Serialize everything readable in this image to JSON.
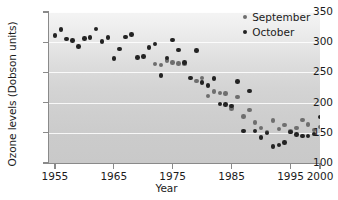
{
  "chart_data": {
    "type": "scatter",
    "title": "",
    "xlabel": "Year",
    "ylabel": "Ozone levels (Dobson units)",
    "xlim": [
      1954,
      2000
    ],
    "ylim": [
      100,
      350
    ],
    "xticks": [
      1955,
      1965,
      1975,
      1985,
      1995,
      2000
    ],
    "xtick_labels": [
      "1955",
      "1965",
      "1975",
      "1985",
      "1995",
      "2000"
    ],
    "yticks": [
      100,
      150,
      200,
      250,
      300,
      350
    ],
    "ytick_labels": [
      "100",
      "150",
      "200",
      "250",
      "300",
      "350"
    ],
    "grid": "horizontal",
    "legend_position": "top-right",
    "series": [
      {
        "name": "September",
        "color": "#6e6e6e",
        "points": [
          [
            1972,
            264
          ],
          [
            1973,
            262
          ],
          [
            1974,
            270
          ],
          [
            1975,
            266
          ],
          [
            1976,
            265
          ],
          [
            1977,
            264
          ],
          [
            1979,
            236
          ],
          [
            1980,
            241
          ],
          [
            1981,
            211
          ],
          [
            1982,
            218
          ],
          [
            1983,
            216
          ],
          [
            1984,
            215
          ],
          [
            1985,
            190
          ],
          [
            1986,
            209
          ],
          [
            1987,
            177
          ],
          [
            1988,
            188
          ],
          [
            1989,
            167
          ],
          [
            1990,
            158
          ],
          [
            1991,
            151
          ],
          [
            1992,
            170
          ],
          [
            1993,
            156
          ],
          [
            1994,
            163
          ],
          [
            1995,
            152
          ],
          [
            1996,
            158
          ],
          [
            1997,
            171
          ],
          [
            1998,
            164
          ],
          [
            1999,
            155
          ],
          [
            2000,
            160
          ]
        ]
      },
      {
        "name": "October",
        "color": "#232323",
        "points": [
          [
            1955,
            311
          ],
          [
            1956,
            321
          ],
          [
            1957,
            305
          ],
          [
            1958,
            303
          ],
          [
            1959,
            293
          ],
          [
            1960,
            306
          ],
          [
            1961,
            308
          ],
          [
            1962,
            322
          ],
          [
            1963,
            301
          ],
          [
            1964,
            308
          ],
          [
            1965,
            273
          ],
          [
            1966,
            289
          ],
          [
            1967,
            309
          ],
          [
            1968,
            313
          ],
          [
            1969,
            275
          ],
          [
            1970,
            276
          ],
          [
            1971,
            291
          ],
          [
            1972,
            297
          ],
          [
            1973,
            245
          ],
          [
            1974,
            274
          ],
          [
            1975,
            304
          ],
          [
            1976,
            287
          ],
          [
            1977,
            266
          ],
          [
            1978,
            241
          ],
          [
            1979,
            286
          ],
          [
            1980,
            233
          ],
          [
            1981,
            228
          ],
          [
            1982,
            240
          ],
          [
            1983,
            198
          ],
          [
            1984,
            197
          ],
          [
            1985,
            194
          ],
          [
            1986,
            235
          ],
          [
            1987,
            153
          ],
          [
            1988,
            219
          ],
          [
            1989,
            153
          ],
          [
            1990,
            142
          ],
          [
            1991,
            150
          ],
          [
            1992,
            127
          ],
          [
            1993,
            130
          ],
          [
            1994,
            134
          ],
          [
            1995,
            151
          ],
          [
            1996,
            147
          ],
          [
            1997,
            145
          ],
          [
            1998,
            145
          ],
          [
            1999,
            148
          ],
          [
            2000,
            176
          ]
        ]
      }
    ]
  },
  "legend": {
    "items": [
      {
        "label": "September",
        "color": "#6e6e6e"
      },
      {
        "label": "October",
        "color": "#232323"
      }
    ]
  },
  "axes": {
    "y_title": "Ozone levels (Dobson units)",
    "x_title": "Year"
  }
}
